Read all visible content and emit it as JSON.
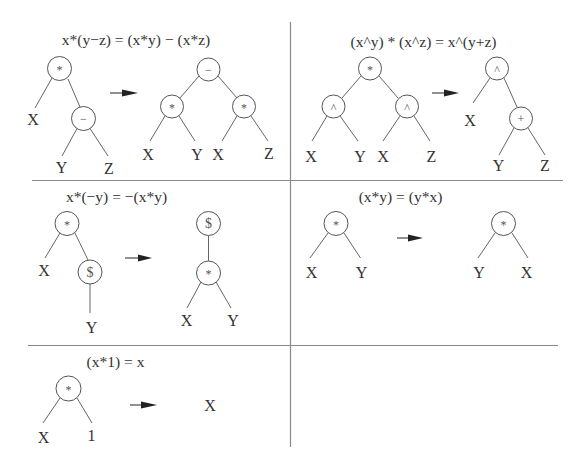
{
  "colors": {
    "ink": "#333333",
    "line": "#666666",
    "background": "#ffffff"
  },
  "figure": {
    "panels": [
      {
        "equation": "x*(y−z) = (x*y) − (x*z)",
        "before": [
          "*",
          "X",
          "−",
          "Y",
          "Z"
        ],
        "after": [
          "−",
          "*",
          "*",
          "X",
          "Y",
          "X",
          "Z"
        ]
      },
      {
        "equation": "(x^y) * (x^z) = x^(y+z)",
        "before": [
          "*",
          "^",
          "^",
          "X",
          "Y",
          "X",
          "Z"
        ],
        "after": [
          "^",
          "X",
          "+",
          "Y",
          "Z"
        ]
      },
      {
        "equation": "x*(−y) = −(x*y)",
        "before": [
          "*",
          "X",
          "$",
          "Y"
        ],
        "after": [
          "$",
          "*",
          "X",
          "Y"
        ]
      },
      {
        "equation": "(x*y) = (y*x)",
        "before": [
          "*",
          "X",
          "Y"
        ],
        "after": [
          "*",
          "Y",
          "X"
        ]
      },
      {
        "equation": "(x*1) = x",
        "before": [
          "*",
          "X",
          "1"
        ],
        "after": [
          "X"
        ]
      }
    ]
  }
}
